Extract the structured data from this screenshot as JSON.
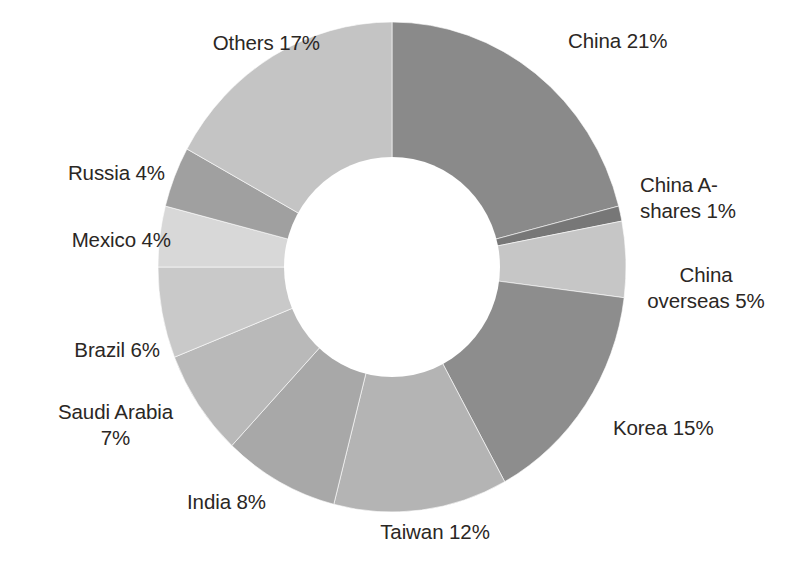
{
  "chart_data": {
    "type": "pie",
    "variant": "donut",
    "title": "",
    "subtitle": "",
    "xlabel": "",
    "ylabel": "",
    "unit": "percent",
    "legend_position": "none",
    "grid": false,
    "labels_show_percent": true,
    "start_angle_deg": 0,
    "direction": "clockwise",
    "inner_radius_ratio": 0.45,
    "categories": [
      "China",
      "China A-shares",
      "China overseas",
      "Korea",
      "Taiwan",
      "India",
      "Saudi Arabia",
      "Brazil",
      "Mexico",
      "Russia",
      "Others"
    ],
    "values": [
      21,
      1,
      5,
      15,
      12,
      8,
      7,
      6,
      4,
      4,
      17
    ],
    "colors": [
      "#8a8a8a",
      "#777777",
      "#c6c6c6",
      "#8d8d8d",
      "#b4b4b4",
      "#a8a8a8",
      "#b9b9b9",
      "#c9c9c9",
      "#d8d8d8",
      "#a0a0a0",
      "#c4c4c4"
    ],
    "slices": [
      {
        "label": "China",
        "value": 21,
        "text": "China 21%",
        "color": "#8a8a8a"
      },
      {
        "label": "China A-shares",
        "value": 1,
        "text": "China A-\nshares 1%",
        "color": "#777777"
      },
      {
        "label": "China overseas",
        "value": 5,
        "text": "China\noverseas 5%",
        "color": "#c6c6c6"
      },
      {
        "label": "Korea",
        "value": 15,
        "text": "Korea 15%",
        "color": "#8d8d8d"
      },
      {
        "label": "Taiwan",
        "value": 12,
        "text": "Taiwan 12%",
        "color": "#b4b4b4"
      },
      {
        "label": "India",
        "value": 8,
        "text": "India 8%",
        "color": "#a8a8a8"
      },
      {
        "label": "Saudi Arabia",
        "value": 7,
        "text": "Saudi Arabia\n7%",
        "color": "#b9b9b9"
      },
      {
        "label": "Brazil",
        "value": 6,
        "text": "Brazil 6%",
        "color": "#c9c9c9"
      },
      {
        "label": "Mexico",
        "value": 4,
        "text": "Mexico 4%",
        "color": "#d8d8d8"
      },
      {
        "label": "Russia",
        "value": 4,
        "text": "Russia 4%",
        "color": "#a0a0a0"
      },
      {
        "label": "Others",
        "value": 17,
        "text": "Others 17%",
        "color": "#c4c4c4"
      }
    ]
  },
  "labels": {
    "china": "China 21%",
    "china_a_shares": "China A-\nshares 1%",
    "china_overseas": "China\noverseas 5%",
    "korea": "Korea 15%",
    "taiwan": "Taiwan 12%",
    "india": "India 8%",
    "saudi_arabia": "Saudi Arabia\n7%",
    "brazil": "Brazil 6%",
    "mexico": "Mexico 4%",
    "russia": "Russia 4%",
    "others": "Others 17%"
  },
  "style": {
    "background": "#ffffff",
    "text_color": "#2b2724",
    "hole_color": "#ffffff"
  }
}
